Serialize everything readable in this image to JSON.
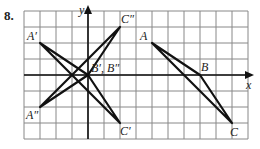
{
  "problem_number": "8.",
  "axes": {
    "x_label": "x",
    "y_label": "y"
  },
  "grid": {
    "origin_px": [
      88,
      75
    ],
    "cell_px": 16,
    "cols_left": 4,
    "cols_right": 10,
    "rows_up": 4,
    "rows_down": 4
  },
  "labels": {
    "A": "A",
    "B": "B",
    "C": "C",
    "A_prime": "A′",
    "C_prime": "C′",
    "B_both": "B′, B″",
    "A_dprime": "A″",
    "C_dprime": "C″"
  },
  "points": {
    "A": [
      4,
      2
    ],
    "B": [
      7,
      0
    ],
    "C": [
      9,
      -3
    ],
    "A_prime": [
      -3,
      2
    ],
    "B_prime": [
      0,
      0
    ],
    "C_prime": [
      2,
      -3
    ],
    "A_dprime": [
      -3,
      -2
    ],
    "B_dprime": [
      0,
      0
    ],
    "C_dprime": [
      2,
      3
    ]
  },
  "colors": {
    "grid": "#888888",
    "line": "#111111",
    "text": "#222222"
  }
}
